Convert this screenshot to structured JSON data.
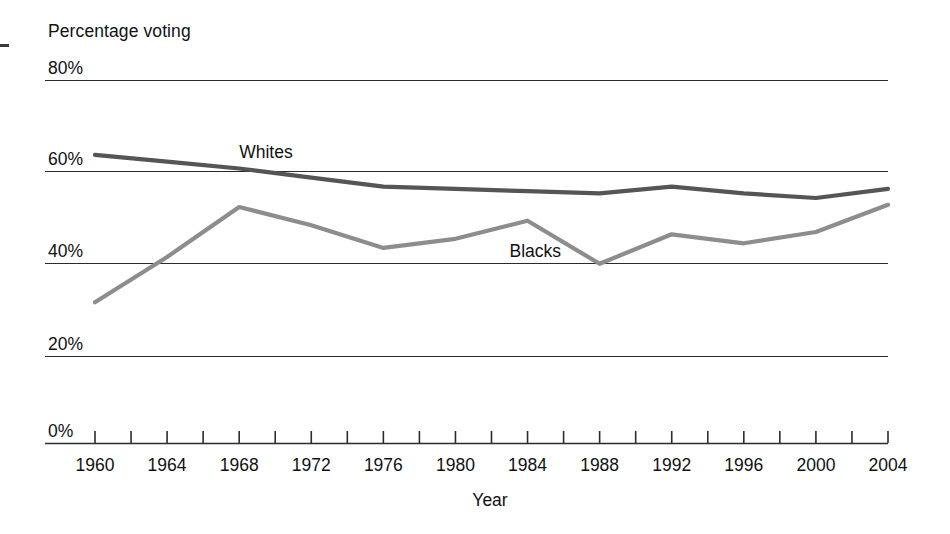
{
  "chart_data": {
    "type": "line",
    "title": "",
    "ylabel": "Percentage voting",
    "xlabel": "Year",
    "ylim": [
      0,
      80
    ],
    "xlim": [
      1960,
      2004
    ],
    "grid": true,
    "legend_position": "inline-annotation",
    "ytick_labels": [
      "80%",
      "60%",
      "40%",
      "20%",
      "0%"
    ],
    "ytick_values": [
      80,
      60,
      40,
      20,
      0
    ],
    "xtick_labels": [
      "1960",
      "1964",
      "1968",
      "1972",
      "1976",
      "1980",
      "1984",
      "1988",
      "1992",
      "1996",
      "2000",
      "2004"
    ],
    "x": [
      1960,
      1964,
      1968,
      1972,
      1976,
      1980,
      1984,
      1988,
      1992,
      1996,
      2000,
      2004
    ],
    "series": [
      {
        "name": "Whites",
        "color": "#555555",
        "values": [
          63.5,
          62.0,
          60.5,
          58.5,
          56.5,
          56.0,
          55.5,
          55.0,
          56.5,
          55.0,
          54.0,
          56.0
        ],
        "label_x": 1968,
        "label_y": 64
      },
      {
        "name": "Blacks",
        "color": "#8d8d8d",
        "values": [
          31.0,
          41.0,
          52.0,
          48.0,
          43.0,
          45.0,
          49.0,
          39.5,
          46.0,
          44.0,
          46.5,
          52.5
        ],
        "label_x": 1983,
        "label_y": 42
      }
    ]
  },
  "axes": {
    "y_title": "Percentage voting",
    "x_title": "Year"
  }
}
